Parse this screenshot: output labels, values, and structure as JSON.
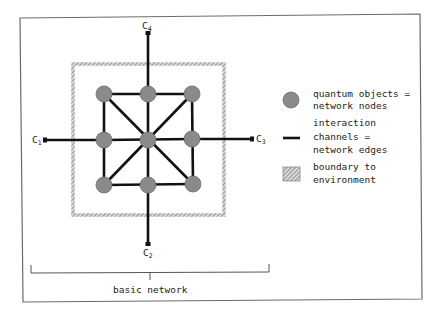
{
  "figure": {
    "colors": {
      "frame": "#6a6a6a",
      "edge": "#111111",
      "node": "#8a8a8a",
      "boundary": "#9a9a9a",
      "text": "#222222"
    }
  },
  "channels": [
    {
      "id": "C1",
      "base": "C",
      "sub": "1"
    },
    {
      "id": "C2",
      "base": "C",
      "sub": "2"
    },
    {
      "id": "C3",
      "base": "C",
      "sub": "3"
    },
    {
      "id": "C4",
      "base": "C",
      "sub": "4"
    }
  ],
  "legend": {
    "nodes": {
      "line1": "quantum objects =",
      "line2": "network nodes"
    },
    "edges": {
      "line1": "interaction",
      "line2": "channels =",
      "line3": "network edges"
    },
    "boundary": {
      "line1": "boundary to",
      "line2": "environment"
    }
  },
  "bracket": {
    "label": "basic network"
  }
}
